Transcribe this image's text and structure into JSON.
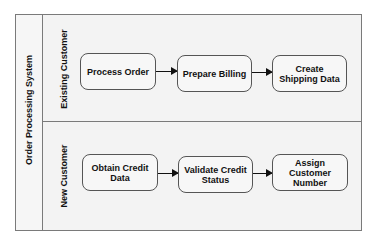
{
  "pool": {
    "title": "Order Processing System"
  },
  "lanes": [
    {
      "label": "Existing Customer",
      "tasks": [
        {
          "label": "Process Order"
        },
        {
          "label": "Prepare Billing"
        },
        {
          "label": "Create Shipping Data"
        }
      ]
    },
    {
      "label": "New Customer",
      "tasks": [
        {
          "label": "Obtain Credit Data"
        },
        {
          "label": "Validate Credit Status"
        },
        {
          "label": "Assign Customer Number"
        }
      ]
    }
  ],
  "colors": {
    "background": "#f3f3f3",
    "border": "#7a7a7a",
    "task_fill": "#f7f7f7",
    "arrow": "#111111"
  }
}
